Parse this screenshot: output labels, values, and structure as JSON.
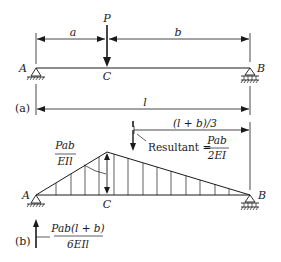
{
  "figure_a": {
    "panel_label": "(a)",
    "load_label": "P",
    "point_labels": {
      "left_support": "A",
      "load_point": "C",
      "right_support": "B"
    },
    "dimensions": {
      "left_segment": "a",
      "right_segment": "b",
      "total_span": "l"
    }
  },
  "figure_b": {
    "panel_label": "(b)",
    "point_labels": {
      "left_support": "A",
      "peak": "C",
      "right_support": "B"
    },
    "peak_value": {
      "numerator": "Pab",
      "denominator": "EIl"
    },
    "resultant": {
      "label": "Resultant =",
      "numerator": "Pab",
      "denominator": "2EI"
    },
    "resultant_distance": "(l + b)/3",
    "left_reaction": {
      "numerator": "Pab(l + b)",
      "denominator": "6EIl"
    }
  },
  "colors": {
    "ink": "#1a1a1a",
    "background": "#ffffff"
  }
}
